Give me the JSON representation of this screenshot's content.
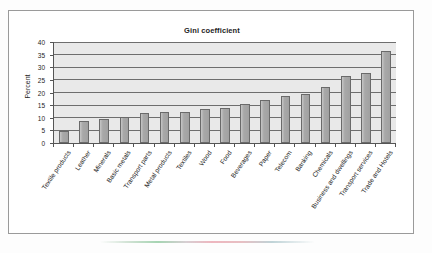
{
  "document": {
    "kind": "scanned-figure-page"
  },
  "chart_data": {
    "type": "bar",
    "title": "Gini coefficient",
    "xlabel": "",
    "ylabel": "Percent",
    "ylim": [
      0,
      40
    ],
    "yticks": [
      0,
      5,
      10,
      15,
      20,
      25,
      30,
      35,
      40
    ],
    "grid": true,
    "legend": "none",
    "categories": [
      "Textile products",
      "Leather",
      "Minerals",
      "Basic metals",
      "Transport parts",
      "Metal products",
      "Textiles",
      "Wood",
      "Food",
      "Beverages",
      "Paper",
      "Telecom",
      "Banking",
      "Chemicals",
      "Business and dwellings",
      "Transport services",
      "Trade and Hotels"
    ],
    "values": [
      4.9,
      8.9,
      9.5,
      10.3,
      11.8,
      12.2,
      12.2,
      13.4,
      13.8,
      15.6,
      17.0,
      18.8,
      19.4,
      22.3,
      26.5,
      27.7,
      36.3
    ],
    "colors": {
      "bar_fill": "#a8a8a8",
      "bar_edge": "#6a6a6a",
      "plot_background": "#e9e9e9",
      "gridline": "#6e6e6e",
      "axis": "#555555",
      "text": "#1d1d1d",
      "frame_border": "#9a9a9a",
      "page_background": "#ffffff"
    }
  }
}
